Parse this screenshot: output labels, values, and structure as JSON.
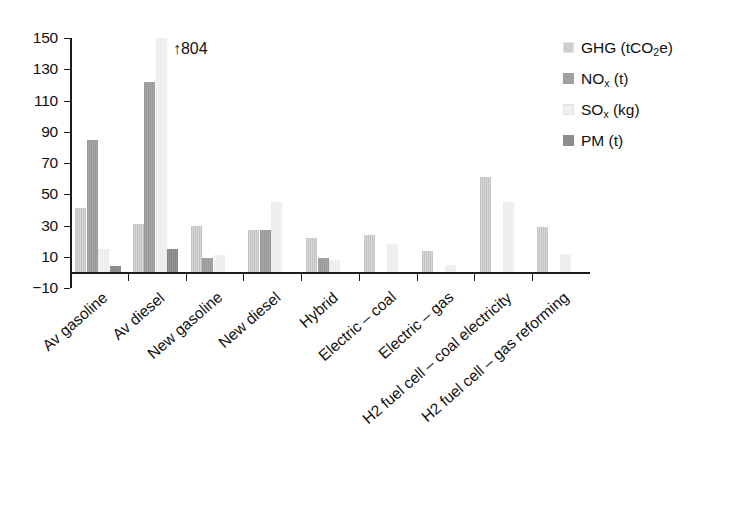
{
  "chart_data": {
    "type": "bar",
    "title": "",
    "xlabel": "",
    "ylabel": "",
    "ylim": [
      -10,
      150
    ],
    "yticks": [
      -10,
      10,
      30,
      50,
      70,
      90,
      110,
      130,
      150
    ],
    "grid": false,
    "legend_position": "top-right",
    "categories": [
      "Av gasoline",
      "Av diesel",
      "New gasoline",
      "New diesel",
      "Hybrid",
      "Electric – coal",
      "Electric – gas",
      "H2 fuel cell – coal electricity",
      "H2 fuel cell – gas reforming"
    ],
    "series": [
      {
        "name": "GHG (tCO2e)",
        "key": "ghg",
        "color": "#cdcdcd",
        "values": [
          41,
          31,
          30,
          27,
          22,
          24,
          14,
          61,
          29
        ]
      },
      {
        "name": "NOx (t)",
        "key": "nox",
        "color": "#a0a0a0",
        "values": [
          85,
          122,
          9,
          27,
          9,
          0,
          0,
          0,
          0
        ]
      },
      {
        "name": "SOx (kg)",
        "key": "sox",
        "color": "#efefef",
        "values": [
          15,
          804,
          11,
          45,
          8,
          18,
          5,
          45,
          12
        ]
      },
      {
        "name": "PM (t)",
        "key": "pm",
        "color": "#8d8d8d",
        "values": [
          4,
          15,
          0,
          0,
          0,
          0,
          0,
          0,
          0
        ]
      }
    ],
    "clipped": [
      {
        "category": "Av diesel",
        "series": "SOx (kg)",
        "value": 804,
        "display_cap": 150
      }
    ],
    "annotations": [
      {
        "name": "sox-av-diesel-overflow",
        "text": "804",
        "arrow": "↑"
      }
    ]
  },
  "legend": {
    "entries": [
      {
        "label_main": "GHG (tCO",
        "label_sub": "2",
        "label_tail": "e)",
        "color": "#cdcdcd",
        "swatch_name": "legend-swatch-ghg"
      },
      {
        "label_main": "NO",
        "label_sub": "x",
        "label_tail": " (t)",
        "color": "#a0a0a0",
        "swatch_name": "legend-swatch-nox"
      },
      {
        "label_main": "SO",
        "label_sub": "x",
        "label_tail": " (kg)",
        "color": "#efefef",
        "swatch_name": "legend-swatch-sox"
      },
      {
        "label_main": "PM (t)",
        "label_sub": "",
        "label_tail": "",
        "color": "#8d8d8d",
        "swatch_name": "legend-swatch-pm"
      }
    ]
  },
  "axis": {
    "y_tick_labels": [
      "150",
      "130",
      "110",
      "90",
      "70",
      "50",
      "30",
      "10",
      "−10"
    ]
  },
  "annotation": {
    "arrow": "↑",
    "value": "804"
  }
}
